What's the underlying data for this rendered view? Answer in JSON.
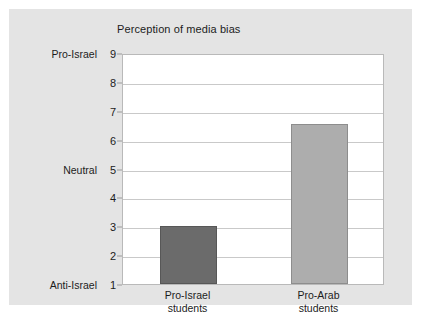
{
  "chart_data": {
    "type": "bar",
    "title": "Perception of media bias",
    "xlabel": "",
    "ylabel": "",
    "categories": [
      "Pro-Israel\nstudents",
      "Pro-Arab\nstudents"
    ],
    "values": [
      3.0,
      6.55
    ],
    "bar_colors": [
      "#6b6b6b",
      "#adadad"
    ],
    "ylim": [
      1,
      9
    ],
    "ytick_values": [
      1,
      2,
      3,
      4,
      5,
      6,
      7,
      8,
      9
    ],
    "ytick_labels": [
      "1",
      "2",
      "3",
      "4",
      "5",
      "6",
      "7",
      "8",
      "9"
    ],
    "y_category_labels": [
      {
        "value": 9,
        "label": "Pro-Israel"
      },
      {
        "value": 5,
        "label": "Neutral"
      },
      {
        "value": 1,
        "label": "Anti-Israel"
      }
    ],
    "grid": true,
    "legend": "none",
    "series": [
      {
        "name": "Perception of media bias",
        "values": [
          3.0,
          6.55
        ]
      }
    ]
  },
  "colors": {
    "page_background": "#ffffff",
    "panel_background": "#e4e4e4",
    "plot_background": "#ffffff",
    "gridline": "#c9c9c9",
    "plot_border": "#b9b9b9",
    "text": "#1c1c1c"
  }
}
